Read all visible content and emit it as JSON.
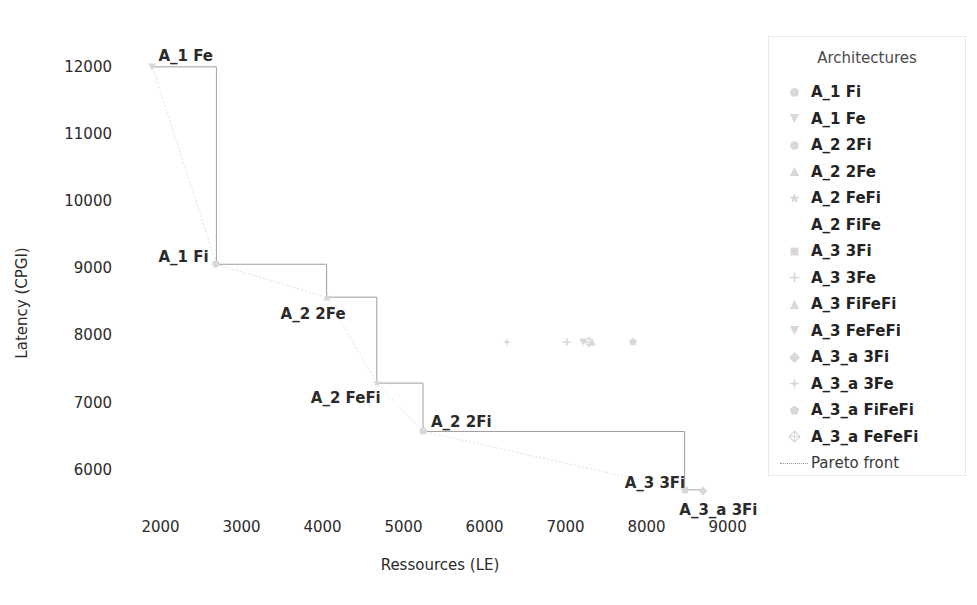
{
  "chart_data": {
    "type": "scatter",
    "title": "",
    "xlabel": "Ressources (LE)",
    "ylabel": "Latency (CPGI)",
    "xlim": [
      1500,
      9400
    ],
    "ylim": [
      5400,
      12400
    ],
    "xticks": [
      2000,
      3000,
      4000,
      5000,
      6000,
      7000,
      8000,
      9000
    ],
    "yticks": [
      6000,
      7000,
      8000,
      9000,
      10000,
      11000,
      12000
    ],
    "grid": false,
    "legend_position": "right",
    "legend_title": "Architectures",
    "series": [
      {
        "name": "A_1 Fi",
        "marker": "octagon",
        "x": [
          2690
        ],
        "y": [
          9060
        ]
      },
      {
        "name": "A_1 Fe",
        "marker": "triangle-down",
        "x": [
          1900
        ],
        "y": [
          12000
        ]
      },
      {
        "name": "A_2 2Fi",
        "marker": "circle",
        "x": [
          5240
        ],
        "y": [
          6570
        ]
      },
      {
        "name": "A_2 2Fe",
        "marker": "triangle-up",
        "x": [
          4050
        ],
        "y": [
          8570
        ]
      },
      {
        "name": "A_2 FeFi",
        "marker": "star",
        "x": [
          4670
        ],
        "y": [
          7290
        ]
      },
      {
        "name": "A_2 FiFe",
        "marker": "none",
        "x": [
          6760
        ],
        "y": [
          7900
        ]
      },
      {
        "name": "A_3 3Fi",
        "marker": "square",
        "x": [
          8470
        ],
        "y": [
          5700
        ]
      },
      {
        "name": "A_3 3Fe",
        "marker": "plus",
        "x": [
          7020
        ],
        "y": [
          7900
        ]
      },
      {
        "name": "A_3 FiFeFi",
        "marker": "triangle-up",
        "x": [
          7330
        ],
        "y": [
          7900
        ]
      },
      {
        "name": "A_3 FeFeFi",
        "marker": "triangle-down",
        "x": [
          7210
        ],
        "y": [
          7900
        ]
      },
      {
        "name": "A_3_a 3Fi",
        "marker": "diamond",
        "x": [
          8700
        ],
        "y": [
          5690
        ]
      },
      {
        "name": "A_3_a 3Fe",
        "marker": "star4",
        "x": [
          6280
        ],
        "y": [
          7900
        ]
      },
      {
        "name": "A_3_a FiFeFi",
        "marker": "pentagon",
        "x": [
          7830
        ],
        "y": [
          7900
        ]
      },
      {
        "name": "A_3_a FeFeFi",
        "marker": "diamond-plus",
        "x": [
          7290
        ],
        "y": [
          7900
        ]
      }
    ],
    "pareto_front": {
      "label": "Pareto front",
      "points": [
        {
          "label": "A_1 Fe",
          "x": 1900,
          "y": 12000
        },
        {
          "label": "A_1 Fi",
          "x": 2690,
          "y": 9060
        },
        {
          "label": "A_2 2Fe",
          "x": 4050,
          "y": 8570
        },
        {
          "label": "A_2 FeFi",
          "x": 4670,
          "y": 7290
        },
        {
          "label": "A_2 2Fi",
          "x": 5240,
          "y": 6570
        },
        {
          "label": "A_3 3Fi",
          "x": 8470,
          "y": 5700
        },
        {
          "label": "A_3_a 3Fi",
          "x": 8700,
          "y": 5690
        }
      ]
    },
    "annotations": [
      {
        "text": "A_1 Fe",
        "x": 1900,
        "y": 12000
      },
      {
        "text": "A_1 Fi",
        "x": 2690,
        "y": 9060
      },
      {
        "text": "A_2 2Fe",
        "x": 4050,
        "y": 8570
      },
      {
        "text": "A_2 FeFi",
        "x": 4670,
        "y": 7290
      },
      {
        "text": "A_2 2Fi",
        "x": 5240,
        "y": 6570
      },
      {
        "text": "A_3 3Fi",
        "x": 8470,
        "y": 5700
      },
      {
        "text": "A_3_a 3Fi",
        "x": 8700,
        "y": 5690
      }
    ]
  },
  "axis": {
    "xlabel": "Ressources (LE)",
    "ylabel": "Latency (CPGI)",
    "xticks": [
      "2000",
      "3000",
      "4000",
      "5000",
      "6000",
      "7000",
      "8000",
      "9000"
    ],
    "yticks": [
      "6000",
      "7000",
      "8000",
      "9000",
      "10000",
      "11000",
      "12000"
    ]
  },
  "legend": {
    "title": "Architectures",
    "entries": [
      {
        "label": "A_1 Fi",
        "marker": "octagon-icon"
      },
      {
        "label": "A_1 Fe",
        "marker": "triangle-down-icon"
      },
      {
        "label": "A_2 2Fi",
        "marker": "circle-icon"
      },
      {
        "label": "A_2 2Fe",
        "marker": "triangle-up-icon"
      },
      {
        "label": "A_2 FeFi",
        "marker": "star-icon"
      },
      {
        "label": "A_2 FiFe",
        "marker": "blank-icon"
      },
      {
        "label": "A_3 3Fi",
        "marker": "square-icon"
      },
      {
        "label": "A_3 3Fe",
        "marker": "plus-icon"
      },
      {
        "label": "A_3 FiFeFi",
        "marker": "triangle-up-icon"
      },
      {
        "label": "A_3 FeFeFi",
        "marker": "triangle-down-icon"
      },
      {
        "label": "A_3_a 3Fi",
        "marker": "diamond-icon"
      },
      {
        "label": "A_3_a 3Fe",
        "marker": "star4-icon"
      },
      {
        "label": "A_3_a FiFeFi",
        "marker": "pentagon-icon"
      },
      {
        "label": "A_3_a FeFeFi",
        "marker": "diamond-plus-icon"
      },
      {
        "label": "Pareto front",
        "marker": "line-icon"
      }
    ]
  },
  "colors": {
    "background": "#ffffff",
    "text": "#2b2b2b",
    "marker": "#d8d8d8",
    "pareto_line": "#9e9e9e",
    "legend_border": "#e8e8e8"
  }
}
